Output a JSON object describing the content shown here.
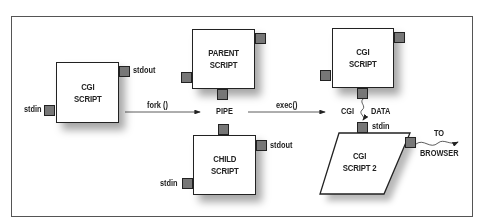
{
  "diagram": {
    "title": "",
    "nodes": {
      "cgi_script": {
        "label": "CGI\nSCRIPT"
      },
      "parent_script": {
        "label": "PARENT\nSCRIPT"
      },
      "child_script": {
        "label": "CHILD\nSCRIPT"
      },
      "cgi_script_right": {
        "label": "CGI\nSCRIPT"
      },
      "cgi_script_2": {
        "label": "CGI\nSCRIPT 2"
      }
    },
    "labels": {
      "stdin_cgi": "stdin",
      "stdout_cgi": "stdout",
      "fork": "fork ()",
      "pipe": "PIPE",
      "exec": "exec()",
      "stdout_child": "stdout",
      "stdin_child": "stdin",
      "cgi_data_left": "CGI",
      "cgi_data_right": "DATA",
      "stdin_cgi2": "stdin",
      "to": "TO",
      "browser": "BROWSER"
    },
    "edges": [
      {
        "from": "cgi_script",
        "to": "pipe",
        "label": "fork ()"
      },
      {
        "from": "pipe",
        "to": "cgi_script_right",
        "label": "exec()"
      },
      {
        "from": "cgi_script_right",
        "to": "cgi_script_2",
        "label": "CGI DATA"
      },
      {
        "from": "cgi_script_2",
        "to": "browser",
        "label": "TO BROWSER"
      }
    ],
    "colors": {
      "port": "#777777",
      "stroke": "#222222",
      "frame": "#555555"
    }
  }
}
